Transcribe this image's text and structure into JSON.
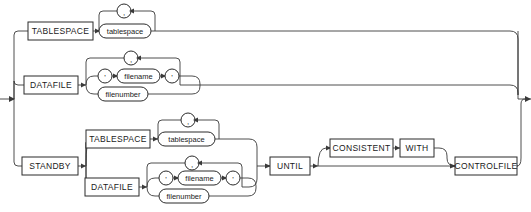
{
  "diagram": {
    "type": "railroad-syntax-diagram",
    "title": "",
    "colors": {
      "background": "#ffffff",
      "line": "#3a3a3a",
      "box_stroke": "#2b2b2b",
      "text": "#1a1a1a"
    },
    "keywords": {
      "tablespace": "TABLESPACE",
      "datafile": "DATAFILE",
      "standby": "STANDBY",
      "standby_tablespace": "TABLESPACE",
      "standby_datafile": "DATAFILE",
      "until": "UNTIL",
      "consistent": "CONSISTENT",
      "with": "WITH",
      "controlfile": "CONTROLFILE"
    },
    "nonterminals": {
      "tablespace_name": "tablespace",
      "filename": "filename",
      "filenumber": "filenumber",
      "standby_tablespace_name": "tablespace",
      "standby_filename": "filename",
      "standby_filenumber": "filenumber"
    },
    "punctuation": {
      "comma_loop_1": ",",
      "comma_loop_2": ",",
      "comma_loop_3": ",",
      "comma_loop_4": ",",
      "quote_open_1": "'",
      "quote_close_1": "'",
      "quote_open_2": "'",
      "quote_close_2": "'"
    },
    "branches": [
      {
        "label": "TABLESPACE",
        "items": [
          "tablespace"
        ],
        "repeatable": true
      },
      {
        "label": "DATAFILE",
        "items": [
          "' filename '",
          "filenumber"
        ],
        "repeatable": true
      },
      {
        "label": "STANDBY",
        "items": [
          "TABLESPACE tablespace",
          "DATAFILE ' filename ' | filenumber"
        ],
        "repeatable": true
      }
    ],
    "tail": {
      "required": [
        "UNTIL",
        "CONTROLFILE"
      ],
      "optional": [
        "CONSISTENT",
        "WITH"
      ]
    }
  }
}
